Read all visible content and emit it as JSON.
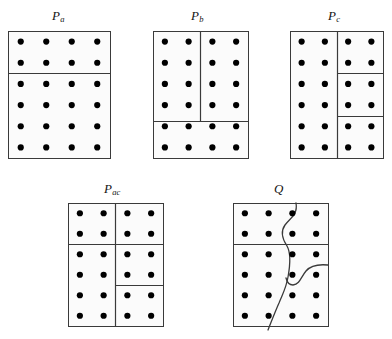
{
  "figure": {
    "background_color": "#ffffff",
    "box_fill": "#fbfbfb",
    "box_stroke": "#3a3a3a",
    "divider_stroke": "#3a3a3a",
    "dot_color": "#000000",
    "dot_radius": 3.1,
    "grid": {
      "columns": 4,
      "rows": 6
    }
  },
  "panels": [
    {
      "id": "Pa",
      "label_base": "P",
      "label_sub": "a",
      "label_x": 52,
      "label_y": 8,
      "box": {
        "x": 8,
        "y": 31,
        "w": 102,
        "h": 127
      },
      "dot_count": 24,
      "dividers": [
        {
          "type": "horizontal",
          "name": "row2-full",
          "x1": 8,
          "y1": 73,
          "x2": 110,
          "y2": 73
        }
      ],
      "region_count": 2
    },
    {
      "id": "Pb",
      "label_base": "P",
      "label_sub": "b",
      "label_x": 191,
      "label_y": 8,
      "box": {
        "x": 153,
        "y": 31,
        "w": 95,
        "h": 127
      },
      "dot_count": 24,
      "dividers": [
        {
          "type": "horizontal",
          "name": "row4-full",
          "x1": 153,
          "y1": 121,
          "x2": 248,
          "y2": 121
        },
        {
          "type": "vertical",
          "name": "col2-top",
          "x1": 200,
          "y1": 31,
          "x2": 200,
          "y2": 121
        }
      ],
      "region_count": 3
    },
    {
      "id": "Pc",
      "label_base": "P",
      "label_sub": "c",
      "label_x": 328,
      "label_y": 8,
      "box": {
        "x": 290,
        "y": 31,
        "w": 93,
        "h": 127
      },
      "dot_count": 24,
      "dividers": [
        {
          "type": "vertical",
          "name": "col2-full",
          "x1": 337,
          "y1": 31,
          "x2": 337,
          "y2": 158
        },
        {
          "type": "horizontal",
          "name": "row2-right",
          "x1": 337,
          "y1": 73,
          "x2": 383,
          "y2": 73
        },
        {
          "type": "horizontal",
          "name": "row4-right",
          "x1": 337,
          "y1": 116,
          "x2": 383,
          "y2": 116
        }
      ],
      "region_count": 4
    },
    {
      "id": "Pac",
      "label_base": "P",
      "label_sub": "ac",
      "label_x": 104,
      "label_y": 181,
      "box": {
        "x": 68,
        "y": 203,
        "w": 95,
        "h": 123
      },
      "dot_count": 24,
      "dividers": [
        {
          "type": "vertical",
          "name": "col2-full",
          "x1": 115,
          "y1": 203,
          "x2": 115,
          "y2": 326
        },
        {
          "type": "horizontal",
          "name": "row2-full",
          "x1": 68,
          "y1": 244,
          "x2": 163,
          "y2": 244
        },
        {
          "type": "horizontal",
          "name": "row4-right",
          "x1": 115,
          "y1": 285,
          "x2": 163,
          "y2": 285
        }
      ],
      "region_count": 5
    },
    {
      "id": "Q",
      "label_base": "Q",
      "label_sub": "",
      "label_x": 274,
      "label_y": 181,
      "box": {
        "x": 233,
        "y": 203,
        "w": 95,
        "h": 123
      },
      "dot_count": 24,
      "dividers": [
        {
          "type": "horizontal",
          "name": "row2-full",
          "x1": 233,
          "y1": 244,
          "x2": 328,
          "y2": 244
        },
        {
          "type": "curve",
          "name": "main-wavy-boundary",
          "path": "M 296 203 C 298 215, 290 218, 285 225 C 280 232, 283 240, 287 246 C 291 253, 290 266, 288 277 C 286 289, 282 295, 279 303 C 275 312, 272 320, 268 330"
        },
        {
          "type": "curve",
          "name": "right-stub-boundary",
          "path": "M 328 265 C 318 264, 311 265, 306 271 C 301 277, 300 284, 293 285 C 289 285, 287 282, 286 278"
        }
      ],
      "region_count": 4
    }
  ]
}
